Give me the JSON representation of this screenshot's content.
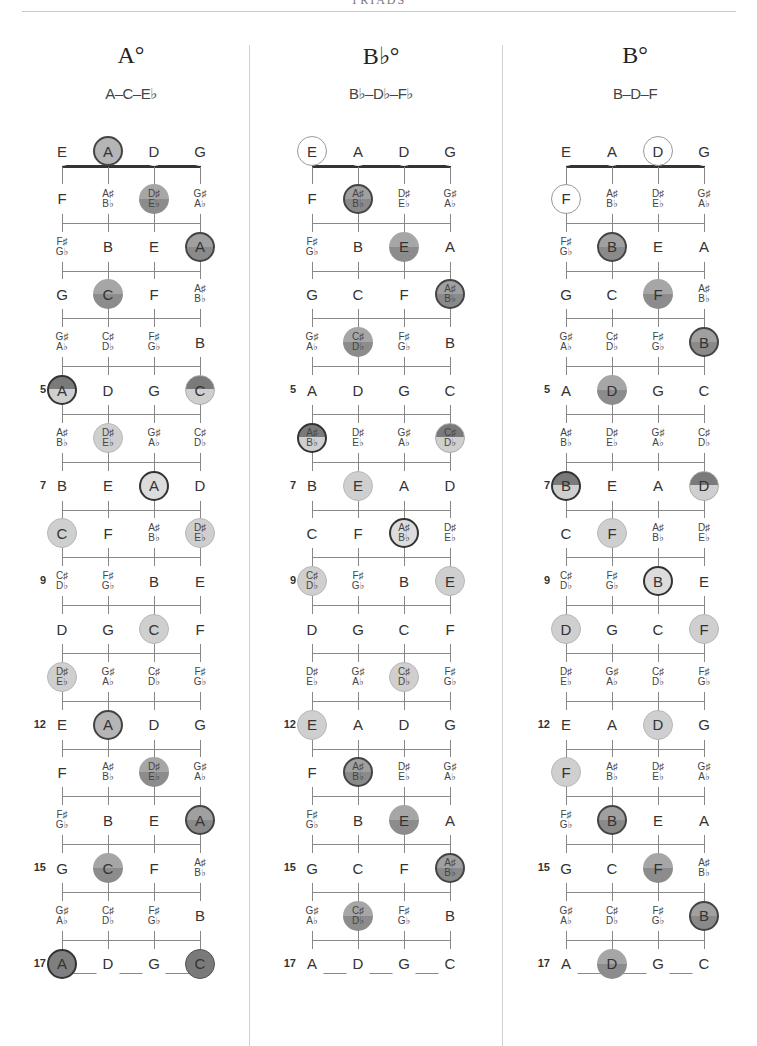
{
  "running_head": "TRIADS",
  "strings": [
    "E",
    "A",
    "D",
    "G"
  ],
  "fret_labels": {
    "5": "5",
    "7": "7",
    "9": "9",
    "12": "12",
    "15": "15",
    "17": "17"
  },
  "fret_notes": [
    [
      "E",
      "A",
      "D",
      "G"
    ],
    [
      "F",
      "A♯|B♭",
      "D♯|E♭",
      "G♯|A♭"
    ],
    [
      "F♯|G♭",
      "B",
      "E",
      "A"
    ],
    [
      "G",
      "C",
      "F",
      "A♯|B♭"
    ],
    [
      "G♯|A♭",
      "C♯|D♭",
      "F♯|G♭",
      "B"
    ],
    [
      "A",
      "D",
      "G",
      "C"
    ],
    [
      "A♯|B♭",
      "D♯|E♭",
      "G♯|A♭",
      "C♯|D♭"
    ],
    [
      "B",
      "E",
      "A",
      "D"
    ],
    [
      "C",
      "F",
      "A♯|B♭",
      "D♯|E♭"
    ],
    [
      "C♯|D♭",
      "F♯|G♭",
      "B",
      "E"
    ],
    [
      "D",
      "G",
      "C",
      "F"
    ],
    [
      "D♯|E♭",
      "G♯|A♭",
      "C♯|D♭",
      "F♯|G♭"
    ],
    [
      "E",
      "A",
      "D",
      "G"
    ],
    [
      "F",
      "A♯|B♭",
      "D♯|E♭",
      "G♯|A♭"
    ],
    [
      "F♯|G♭",
      "B",
      "E",
      "A"
    ],
    [
      "G",
      "C",
      "F",
      "A♯|B♭"
    ],
    [
      "G♯|A♭",
      "C♯|D♭",
      "F♯|G♭",
      "B"
    ],
    [
      "A",
      "D",
      "G",
      "C"
    ]
  ],
  "charts": [
    {
      "name": "A°",
      "notes": "A–C–E♭",
      "highlights": [
        {
          "fret": 0,
          "string": 1,
          "style": "ring"
        },
        {
          "fret": 1,
          "string": 2,
          "style": "mid"
        },
        {
          "fret": 2,
          "string": 3,
          "style": "dark-ring"
        },
        {
          "fret": 3,
          "string": 1,
          "style": "mid"
        },
        {
          "fret": 5,
          "string": 0,
          "style": "split-ring"
        },
        {
          "fret": 5,
          "string": 3,
          "style": "split"
        },
        {
          "fret": 6,
          "string": 1,
          "style": "light"
        },
        {
          "fret": 7,
          "string": 2,
          "style": "ring-white"
        },
        {
          "fret": 8,
          "string": 0,
          "style": "light"
        },
        {
          "fret": 8,
          "string": 3,
          "style": "light"
        },
        {
          "fret": 10,
          "string": 2,
          "style": "light"
        },
        {
          "fret": 11,
          "string": 0,
          "style": "light"
        },
        {
          "fret": 12,
          "string": 1,
          "style": "ring"
        },
        {
          "fret": 13,
          "string": 2,
          "style": "mid"
        },
        {
          "fret": 14,
          "string": 3,
          "style": "dark-ring"
        },
        {
          "fret": 15,
          "string": 1,
          "style": "mid"
        },
        {
          "fret": 17,
          "string": 0,
          "style": "dark-ring-dark"
        },
        {
          "fret": 17,
          "string": 3,
          "style": "dark"
        }
      ]
    },
    {
      "name": "B♭°",
      "notes": "B♭–D♭–F♭",
      "highlights": [
        {
          "fret": 0,
          "string": 0,
          "style": "outline"
        },
        {
          "fret": 1,
          "string": 1,
          "style": "dark-ring"
        },
        {
          "fret": 2,
          "string": 2,
          "style": "mid"
        },
        {
          "fret": 3,
          "string": 3,
          "style": "dark-ring"
        },
        {
          "fret": 4,
          "string": 1,
          "style": "mid"
        },
        {
          "fret": 6,
          "string": 0,
          "style": "split-ring"
        },
        {
          "fret": 6,
          "string": 3,
          "style": "split"
        },
        {
          "fret": 7,
          "string": 1,
          "style": "light"
        },
        {
          "fret": 8,
          "string": 2,
          "style": "ring-white"
        },
        {
          "fret": 9,
          "string": 0,
          "style": "light"
        },
        {
          "fret": 9,
          "string": 3,
          "style": "light"
        },
        {
          "fret": 11,
          "string": 2,
          "style": "light"
        },
        {
          "fret": 12,
          "string": 0,
          "style": "light"
        },
        {
          "fret": 13,
          "string": 1,
          "style": "dark-ring"
        },
        {
          "fret": 14,
          "string": 2,
          "style": "mid"
        },
        {
          "fret": 15,
          "string": 3,
          "style": "dark-ring"
        },
        {
          "fret": 16,
          "string": 1,
          "style": "mid"
        }
      ]
    },
    {
      "name": "B°",
      "notes": "B–D–F",
      "highlights": [
        {
          "fret": 0,
          "string": 2,
          "style": "outline"
        },
        {
          "fret": 1,
          "string": 0,
          "style": "outline"
        },
        {
          "fret": 2,
          "string": 1,
          "style": "dark-ring"
        },
        {
          "fret": 3,
          "string": 2,
          "style": "mid"
        },
        {
          "fret": 4,
          "string": 3,
          "style": "dark-ring"
        },
        {
          "fret": 5,
          "string": 1,
          "style": "mid"
        },
        {
          "fret": 7,
          "string": 0,
          "style": "split-ring"
        },
        {
          "fret": 7,
          "string": 3,
          "style": "split"
        },
        {
          "fret": 8,
          "string": 1,
          "style": "light"
        },
        {
          "fret": 9,
          "string": 2,
          "style": "ring-white"
        },
        {
          "fret": 10,
          "string": 0,
          "style": "light"
        },
        {
          "fret": 10,
          "string": 3,
          "style": "light"
        },
        {
          "fret": 12,
          "string": 2,
          "style": "light"
        },
        {
          "fret": 13,
          "string": 0,
          "style": "light"
        },
        {
          "fret": 14,
          "string": 1,
          "style": "dark-ring"
        },
        {
          "fret": 15,
          "string": 2,
          "style": "mid"
        },
        {
          "fret": 16,
          "string": 3,
          "style": "dark-ring"
        },
        {
          "fret": 17,
          "string": 1,
          "style": "mid"
        }
      ]
    }
  ]
}
